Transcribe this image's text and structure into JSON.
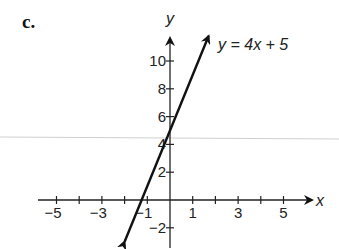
{
  "part_label": "c.",
  "chart_data": {
    "type": "line",
    "title": "",
    "equation_label": "y = 4x + 5",
    "xlabel": "x",
    "ylabel": "y",
    "xlim": [
      -5.5,
      6
    ],
    "ylim": [
      -3,
      11.5
    ],
    "x_ticks": [
      -5,
      -4,
      -3,
      -2,
      -1,
      1,
      2,
      3,
      4,
      5
    ],
    "x_tick_labels": [
      "−5",
      "−3",
      "−1",
      "1",
      "3",
      "5"
    ],
    "x_tick_label_values": [
      -5,
      -3,
      -1,
      1,
      3,
      5
    ],
    "y_ticks": [
      -2,
      2,
      4,
      6,
      8,
      10
    ],
    "y_tick_labels": [
      "−2",
      "2",
      "4",
      "6",
      "8",
      "10"
    ],
    "grid": false,
    "series": [
      {
        "name": "y = 4x + 5",
        "slope": 4,
        "intercept": 5,
        "x": [
          -2,
          1.7
        ],
        "y": [
          -3,
          11.8
        ]
      }
    ]
  }
}
